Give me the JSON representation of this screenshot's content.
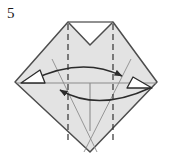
{
  "figure": {
    "step_number": "5",
    "caption": "",
    "type": "origami-folding-diagram",
    "colors": {
      "paper_fill": "#e3e3e3",
      "outline": "#4d4d4d",
      "crease_line": "#8c8c8c",
      "dashed_fold": "#333333",
      "arrow": "#2b2b2b",
      "arrow_fill": "#ffffff",
      "background": "#ffffff",
      "label_text": "#1a1a1a"
    },
    "shape": {
      "name": "notched-diamond",
      "outline_points": "68,22 113,22 113,22 157,82 90,152 15,82",
      "top_edge_left": "68,22",
      "top_edge_right": "113,22",
      "notch_apex": "90,45",
      "left_vertex": "15,82",
      "right_vertex": "157,82",
      "bottom_vertex": "90,152"
    },
    "fold_lines": [
      {
        "name": "valley-fold-left",
        "style": "dashed",
        "from": "68,24",
        "to": "68,140"
      },
      {
        "name": "valley-fold-right",
        "style": "dashed",
        "from": "113,24",
        "to": "113,140"
      }
    ],
    "crease_lines": [
      {
        "name": "crease-diagonal-left",
        "from": "52,59",
        "to": "96,152"
      },
      {
        "name": "crease-diagonal-right",
        "from": "131,59",
        "to": "84,152"
      },
      {
        "name": "crease-horizontal-center",
        "from": "17,83",
        "to": "156,83"
      },
      {
        "name": "crease-vertical-center",
        "from": "90,83",
        "to": "90,131"
      }
    ],
    "arrows": [
      {
        "name": "curved-arrow-right",
        "direction": "left-to-right",
        "head": "solid",
        "path": "M 32,80 Q 90,58 124,76"
      },
      {
        "name": "curved-arrow-left",
        "direction": "right-to-left",
        "head": "solid",
        "path": "M 148,88 Q 90,110 58,90"
      }
    ],
    "open_arrowheads": [
      {
        "name": "open-arrowhead-left",
        "points": "22,83 44,83 39,71",
        "points_to": "left"
      },
      {
        "name": "open-arrowhead-right",
        "points": "150,88 128,88 133,78",
        "points_to": "right"
      }
    ]
  }
}
